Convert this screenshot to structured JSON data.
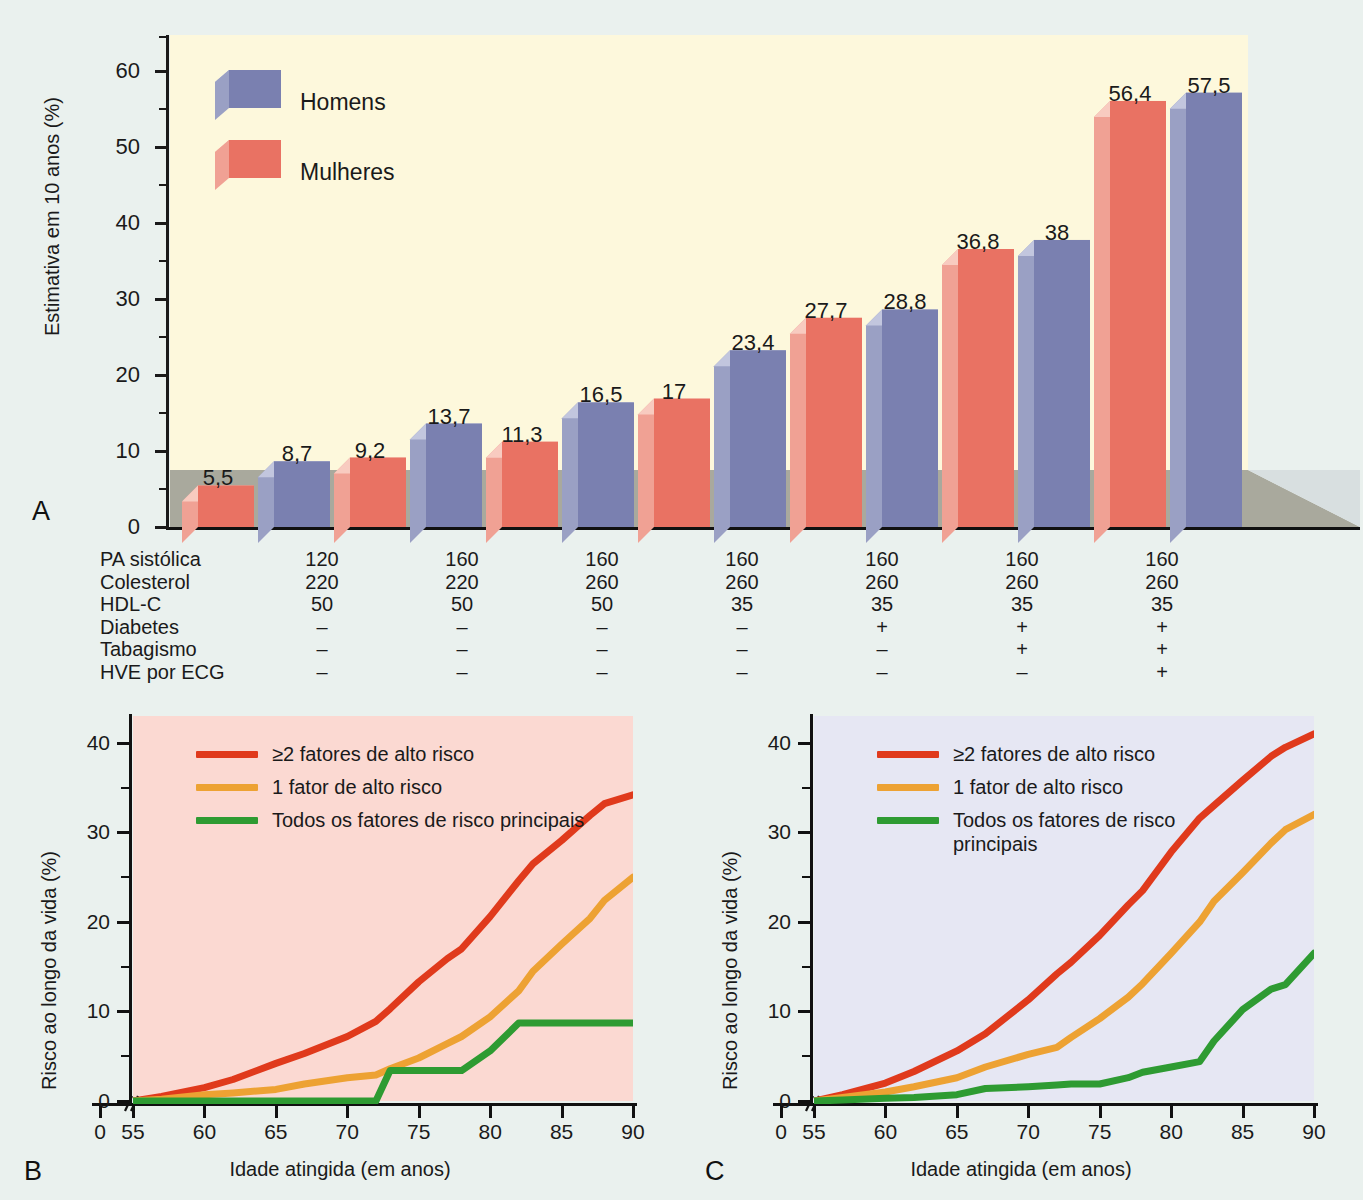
{
  "figure": {
    "panels": [
      "A",
      "B",
      "C"
    ],
    "background_color": "#eaf1ee"
  },
  "panel_a": {
    "letter": "A",
    "plot_background": "#fdf8dc",
    "floor_color": "#a9a99d",
    "ylabel": "Estimativa em 10 anos (%)",
    "yticks": [
      "0",
      "10",
      "20",
      "30",
      "40",
      "50",
      "60"
    ],
    "legend": [
      {
        "label": "Homens",
        "color": "#7a80b0"
      },
      {
        "label": "Mulheres",
        "color": "#e97263"
      }
    ],
    "table": {
      "rows": [
        {
          "label": "PA sistólica",
          "values": [
            "120",
            "160",
            "160",
            "160",
            "160",
            "160",
            "160"
          ]
        },
        {
          "label": "Colesterol",
          "values": [
            "220",
            "220",
            "260",
            "260",
            "260",
            "260",
            "260"
          ]
        },
        {
          "label": "HDL-C",
          "values": [
            "50",
            "50",
            "50",
            "35",
            "35",
            "35",
            "35"
          ]
        },
        {
          "label": "Diabetes",
          "values": [
            "–",
            "–",
            "–",
            "–",
            "+",
            "+",
            "+"
          ]
        },
        {
          "label": "Tabagismo",
          "values": [
            "–",
            "–",
            "–",
            "–",
            "–",
            "+",
            "+"
          ]
        },
        {
          "label": "HVE por ECG",
          "values": [
            "–",
            "–",
            "–",
            "–",
            "–",
            "–",
            "+"
          ]
        }
      ]
    }
  },
  "panel_b": {
    "letter": "B",
    "plot_background": "#fbd9d2",
    "ylabel": "Risco ao longo da vida (%)",
    "xlabel": "Idade atingida (em anos)",
    "yticks": [
      "0",
      "10",
      "20",
      "30",
      "40"
    ],
    "xticks": [
      "0",
      "55",
      "60",
      "65",
      "70",
      "75",
      "80",
      "85",
      "90"
    ],
    "legend": [
      {
        "label": "≥2 fatores de alto risco",
        "color": "#e03a1c"
      },
      {
        "label": "1 fator de alto risco",
        "color": "#eda233"
      },
      {
        "label": "Todos os fatores de risco principais",
        "color": "#2e9b32"
      }
    ]
  },
  "panel_c": {
    "letter": "C",
    "plot_background": "#e6e7f3",
    "ylabel": "Risco ao longo da vida (%)",
    "xlabel": "Idade atingida (em anos)",
    "yticks": [
      "0",
      "10",
      "20",
      "30",
      "40"
    ],
    "xticks": [
      "0",
      "55",
      "60",
      "65",
      "70",
      "75",
      "80",
      "85",
      "90"
    ],
    "legend": [
      {
        "label": "≥2 fatores de alto risco",
        "color": "#e03a1c"
      },
      {
        "label": "1 fator de alto risco",
        "color": "#eda233"
      },
      {
        "label": "Todos os fatores de risco",
        "label2": "principais",
        "color": "#2e9b32"
      }
    ]
  },
  "chart_data": [
    {
      "panel": "A",
      "type": "bar",
      "title": "",
      "ylabel": "Estimativa em 10 anos (%)",
      "xlabel": "",
      "ylim": [
        0,
        65
      ],
      "categories": [
        "1",
        "2",
        "3",
        "4",
        "5",
        "6",
        "7"
      ],
      "grid": false,
      "legend_position": "top-left",
      "series": [
        {
          "name": "Mulheres",
          "color": "#e97263",
          "values": [
            5.5,
            9.2,
            11.3,
            17,
            27.7,
            36.8,
            56.4
          ],
          "data_labels": [
            "5,5",
            "9,2",
            "11,3",
            "17",
            "27,7",
            "36,8",
            "56,4"
          ]
        },
        {
          "name": "Homens",
          "color": "#7a80b0",
          "values": [
            8.7,
            13.7,
            16.5,
            23.4,
            28.8,
            38,
            57.5
          ],
          "data_labels": [
            "8,7",
            "13,7",
            "16,5",
            "23,4",
            "28,8",
            "38",
            "57,5"
          ]
        }
      ],
      "risk_factor_table": {
        "row_labels": [
          "PA sistólica",
          "Colesterol",
          "HDL-C",
          "Diabetes",
          "Tabagismo",
          "HVE por ECG"
        ],
        "columns": [
          [
            "120",
            "220",
            "50",
            "–",
            "–",
            "–"
          ],
          [
            "160",
            "220",
            "50",
            "–",
            "–",
            "–"
          ],
          [
            "160",
            "260",
            "50",
            "–",
            "–",
            "–"
          ],
          [
            "160",
            "260",
            "35",
            "–",
            "–",
            "–"
          ],
          [
            "160",
            "260",
            "35",
            "+",
            "–",
            "–"
          ],
          [
            "160",
            "260",
            "35",
            "+",
            "+",
            "–"
          ],
          [
            "160",
            "260",
            "35",
            "+",
            "+",
            "+"
          ]
        ]
      }
    },
    {
      "panel": "B",
      "type": "line",
      "title": "",
      "ylabel": "Risco ao longo da vida (%)",
      "xlabel": "Idade atingida (em anos)",
      "xlim": [
        55,
        90
      ],
      "ylim": [
        0,
        43
      ],
      "grid": false,
      "legend_position": "top-left",
      "x": [
        55,
        57,
        60,
        62,
        65,
        67,
        70,
        72,
        73,
        75,
        77,
        78,
        80,
        82,
        83,
        85,
        87,
        88,
        90
      ],
      "series": [
        {
          "name": "≥2 fatores de alto risco",
          "color": "#e03a1c",
          "values": [
            0,
            0.5,
            1.5,
            2.4,
            4.2,
            5.3,
            7.2,
            8.9,
            10.3,
            13.3,
            15.9,
            17.0,
            20.6,
            24.6,
            26.5,
            29.1,
            31.9,
            33.2,
            34.2
          ]
        },
        {
          "name": "1 fator de alto risco",
          "color": "#eda233",
          "values": [
            0,
            0.2,
            0.7,
            0.9,
            1.3,
            1.9,
            2.6,
            2.9,
            3.6,
            4.8,
            6.4,
            7.2,
            9.4,
            12.3,
            14.5,
            17.5,
            20.4,
            22.4,
            25.0
          ]
        },
        {
          "name": "Todos os fatores de risco principais",
          "color": "#2e9b32",
          "values": [
            0,
            0,
            0,
            0,
            0,
            0,
            0,
            0,
            3.4,
            3.4,
            3.4,
            3.4,
            5.6,
            8.7,
            8.7,
            8.7,
            8.7,
            8.7,
            8.7
          ]
        }
      ]
    },
    {
      "panel": "C",
      "type": "line",
      "title": "",
      "ylabel": "Risco ao longo da vida (%)",
      "xlabel": "Idade atingida (em anos)",
      "xlim": [
        55,
        90
      ],
      "ylim": [
        0,
        43
      ],
      "grid": false,
      "legend_position": "top-left",
      "x": [
        55,
        57,
        60,
        62,
        65,
        67,
        70,
        72,
        73,
        75,
        77,
        78,
        80,
        82,
        83,
        85,
        87,
        88,
        90
      ],
      "series": [
        {
          "name": "≥2 fatores de alto risco",
          "color": "#e03a1c",
          "values": [
            0,
            0.7,
            2.0,
            3.3,
            5.6,
            7.5,
            11.3,
            14.2,
            15.5,
            18.5,
            21.9,
            23.5,
            27.8,
            31.6,
            33.0,
            35.8,
            38.5,
            39.5,
            41.0
          ]
        },
        {
          "name": "1 fator de alto risco",
          "color": "#eda233",
          "values": [
            0,
            0.4,
            1.0,
            1.6,
            2.6,
            3.8,
            5.2,
            6.0,
            7.1,
            9.2,
            11.6,
            13.1,
            16.5,
            20.0,
            22.3,
            25.5,
            28.8,
            30.3,
            32.0
          ]
        },
        {
          "name": "Todos os fatores de risco principais",
          "color": "#2e9b32",
          "values": [
            0,
            0.1,
            0.3,
            0.4,
            0.7,
            1.4,
            1.6,
            1.8,
            1.9,
            1.9,
            2.6,
            3.2,
            3.8,
            4.4,
            6.7,
            10.2,
            12.5,
            13.0,
            16.5
          ]
        }
      ]
    }
  ]
}
